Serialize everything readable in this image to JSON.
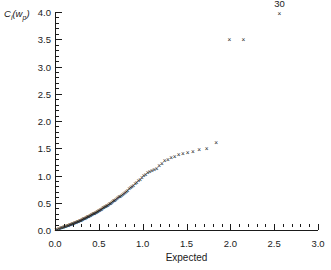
{
  "chart_data": {
    "type": "scatter",
    "title": "",
    "xlabel": "Expected",
    "ylabel": "Cᵢ(wₚ)",
    "ylabel_base": "C",
    "ylabel_sub1": "i",
    "ylabel_mid": "(w",
    "ylabel_sub2": "p",
    "ylabel_end": ")",
    "xlim": [
      0.0,
      3.0
    ],
    "ylim": [
      0.0,
      4.0
    ],
    "xticks": [
      0.0,
      0.5,
      1.0,
      1.5,
      2.0,
      2.5,
      3.0
    ],
    "xtick_labels": [
      "0.0",
      "0.5",
      "1.0",
      "1.5",
      "2.0",
      "2.5",
      "3.0"
    ],
    "yticks": [
      0.0,
      0.5,
      1.0,
      1.5,
      2.0,
      2.5,
      3.0,
      3.5,
      4.0
    ],
    "ytick_labels": [
      "0.0",
      "0.5",
      "1.0",
      "1.5",
      "2.0",
      "2.5",
      "3.0",
      "3.5",
      "4.0"
    ],
    "xminor_step": 0.1,
    "yminor_step": 0.1,
    "grid": false,
    "legend": false,
    "marker": "x",
    "marker_glyph": "×",
    "marker_color": "#1a1a1a",
    "annotations": [
      {
        "text": "30",
        "x": 2.56,
        "y": 3.97,
        "dy_px": -5
      }
    ],
    "x": [
      0.012,
      0.028,
      0.042,
      0.055,
      0.068,
      0.08,
      0.092,
      0.103,
      0.114,
      0.125,
      0.136,
      0.146,
      0.156,
      0.166,
      0.176,
      0.186,
      0.196,
      0.205,
      0.215,
      0.224,
      0.234,
      0.243,
      0.252,
      0.261,
      0.271,
      0.28,
      0.289,
      0.298,
      0.307,
      0.316,
      0.325,
      0.334,
      0.343,
      0.352,
      0.361,
      0.37,
      0.379,
      0.388,
      0.397,
      0.406,
      0.415,
      0.424,
      0.434,
      0.443,
      0.452,
      0.461,
      0.471,
      0.48,
      0.49,
      0.499,
      0.509,
      0.519,
      0.529,
      0.539,
      0.549,
      0.559,
      0.569,
      0.58,
      0.59,
      0.601,
      0.612,
      0.623,
      0.634,
      0.646,
      0.657,
      0.669,
      0.681,
      0.693,
      0.706,
      0.718,
      0.731,
      0.744,
      0.758,
      0.772,
      0.786,
      0.8,
      0.815,
      0.83,
      0.846,
      0.862,
      0.878,
      0.895,
      0.913,
      0.931,
      0.95,
      0.97,
      0.99,
      1.011,
      1.033,
      1.056,
      1.08,
      1.105,
      1.131,
      1.159,
      1.188,
      1.219,
      1.252,
      1.287,
      1.325,
      1.366,
      1.41,
      1.459,
      1.513,
      1.574,
      1.645,
      1.73,
      1.838,
      1.99,
      2.15,
      2.56
    ],
    "y": [
      0.01,
      0.018,
      0.025,
      0.032,
      0.039,
      0.046,
      0.053,
      0.06,
      0.066,
      0.072,
      0.078,
      0.084,
      0.09,
      0.096,
      0.102,
      0.108,
      0.114,
      0.12,
      0.126,
      0.132,
      0.138,
      0.144,
      0.15,
      0.157,
      0.163,
      0.17,
      0.176,
      0.183,
      0.19,
      0.197,
      0.204,
      0.211,
      0.218,
      0.225,
      0.232,
      0.239,
      0.247,
      0.254,
      0.262,
      0.27,
      0.278,
      0.286,
      0.294,
      0.302,
      0.31,
      0.319,
      0.328,
      0.337,
      0.346,
      0.355,
      0.364,
      0.374,
      0.384,
      0.394,
      0.404,
      0.414,
      0.425,
      0.436,
      0.447,
      0.458,
      0.47,
      0.482,
      0.494,
      0.507,
      0.52,
      0.533,
      0.547,
      0.561,
      0.576,
      0.591,
      0.607,
      0.623,
      0.64,
      0.657,
      0.675,
      0.694,
      0.713,
      0.733,
      0.754,
      0.776,
      0.799,
      0.823,
      0.848,
      0.874,
      0.901,
      0.93,
      0.96,
      0.992,
      1.026,
      1.062,
      1.08,
      1.1,
      1.112,
      1.125,
      1.18,
      1.215,
      1.27,
      1.29,
      1.33,
      1.355,
      1.39,
      1.4,
      1.42,
      1.445,
      1.47,
      1.5,
      1.6,
      3.49,
      3.5,
      3.97
    ]
  }
}
